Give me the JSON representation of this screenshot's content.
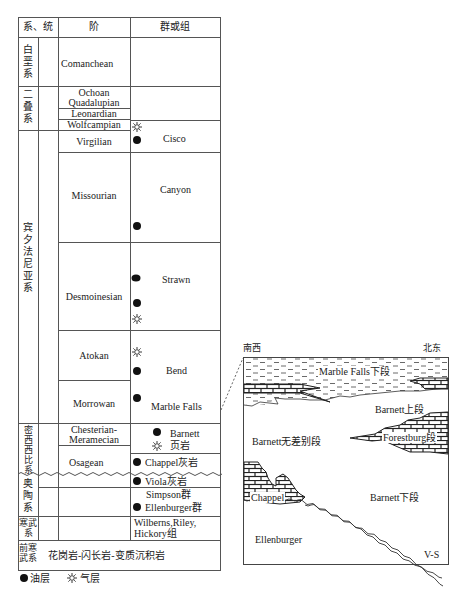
{
  "table": {
    "headers": {
      "system_series": "系、统",
      "stage": "阶",
      "group_formation": "群或组"
    },
    "systems": [
      {
        "id": "cretaceous",
        "label": "白垩系"
      },
      {
        "id": "permian",
        "label": "二叠系"
      },
      {
        "id": "pennsylvanian",
        "label": "宾夕法尼亚系"
      },
      {
        "id": "mississippian",
        "label": "密西西比系"
      },
      {
        "id": "ordovician",
        "label": "奥陶系"
      },
      {
        "id": "cambrian",
        "label": "寒武系"
      },
      {
        "id": "precambrian",
        "label": "前寒武系"
      }
    ],
    "stages": {
      "comanchean": "Comanchean",
      "ochoan": "Ochoan",
      "quadalupian": "Quadalupian",
      "leonardian": "Leonardian",
      "wolfcampian": "Wolfcampian",
      "virgilian": "Virgilian",
      "missourian": "Missourian",
      "desmoinesian": "Desmoinesian",
      "atokan": "Atokan",
      "morrowan": "Morrowan",
      "chesterian": "Chesterian-",
      "meramecian": "Meramecian",
      "osagean": "Osagean"
    },
    "groups": {
      "cisco": "Cisco",
      "canyon": "Canyon",
      "strawn": "Strawn",
      "bend": "Bend",
      "marble_falls": "Marble Falls",
      "barnett": "Barnett",
      "barnett_shale": "页岩",
      "chappel": "Chappel灰岩",
      "viola": "Viola灰岩",
      "simpson": "Simpson群",
      "ellenburger": "Ellenburger群",
      "wilberns_1": "Wilberns,Riley,",
      "wilberns_2": "Hickory组"
    },
    "precambrian_rock": "花岗岩-闪长岩-变质沉积岩"
  },
  "legend": {
    "oil": {
      "icon": "filled-circle",
      "label": "油层"
    },
    "gas": {
      "icon": "sun-star",
      "label": "气层"
    }
  },
  "cross_section": {
    "left_direction": "南西",
    "right_direction": "北东",
    "labels": {
      "marble_falls_lower": "Marble Falls下段",
      "barnett_upper": "Barnett上段",
      "barnett_undiff": "Barnett无差别段",
      "forestburg": "Forestburg段",
      "chappel": "Chappel",
      "barnett_lower": "Barnett下段",
      "ellenburger": "Ellenburger",
      "vs": "V-S"
    }
  },
  "colors": {
    "line": "#555555",
    "text": "#222222",
    "background": "#ffffff"
  }
}
